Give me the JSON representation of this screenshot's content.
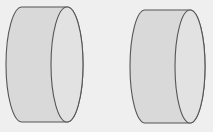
{
  "figure": {
    "colors": {
      "background": "#efefef",
      "fill": "#d9d9d9",
      "face_fill": "#e2e2e2",
      "stroke": "#555555"
    },
    "shapes": [
      {
        "name": "cylinder-left"
      },
      {
        "name": "cylinder-right"
      }
    ]
  }
}
